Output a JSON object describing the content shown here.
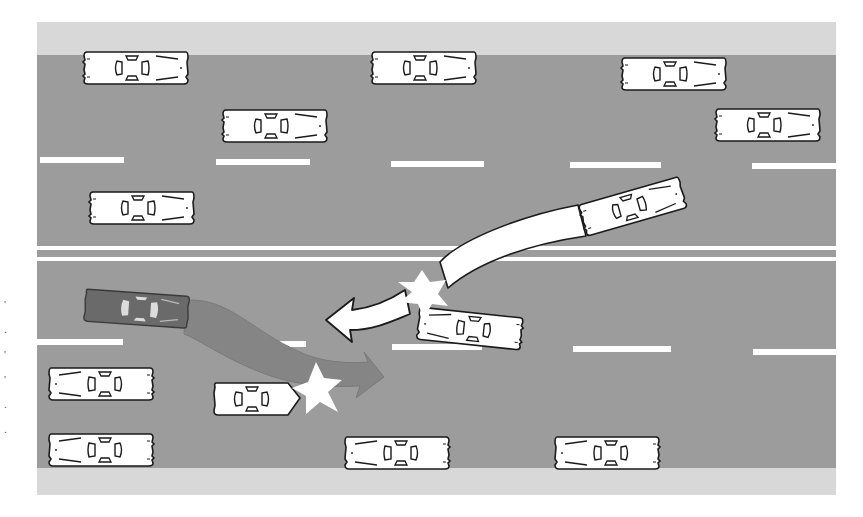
{
  "diagram": {
    "title": "",
    "type": "traffic-crash-illustration",
    "colors": {
      "background": "#ffffff",
      "shoulder": "#d6d6d6",
      "asphalt": "#9c9c9c",
      "lane_marking": "#ffffff",
      "car_body": "#ffffff",
      "car_outline": "#1a1a1a",
      "dark_car_body": "#6a6a6a",
      "white_path": "#ffffff",
      "gray_path": "#808080",
      "impact_star": "#ffffff"
    },
    "road": {
      "x": 37,
      "y": 22,
      "width": 799,
      "height": 473,
      "top_shoulder": {
        "y": 22,
        "height": 33
      },
      "bottom_shoulder": {
        "y": 468,
        "height": 27
      },
      "lane_dash_rows_y": [
        160,
        348
      ],
      "median_lines_y": [
        248,
        258
      ]
    },
    "cars": [
      {
        "id": "car-1",
        "x": 82,
        "y": 50,
        "angle": 0,
        "facing": "right",
        "style": "white"
      },
      {
        "id": "car-2",
        "x": 370,
        "y": 50,
        "angle": 0,
        "facing": "right",
        "style": "white"
      },
      {
        "id": "car-3",
        "x": 620,
        "y": 56,
        "angle": 0,
        "facing": "right",
        "style": "white"
      },
      {
        "id": "car-4",
        "x": 221,
        "y": 108,
        "angle": 0,
        "facing": "right",
        "style": "white"
      },
      {
        "id": "car-5",
        "x": 714,
        "y": 107,
        "angle": 0,
        "facing": "right",
        "style": "white"
      },
      {
        "id": "car-6",
        "x": 88,
        "y": 190,
        "angle": 0,
        "facing": "right",
        "style": "white"
      },
      {
        "id": "car-swerving",
        "x": 575,
        "y": 180,
        "angle": -14,
        "facing": "right",
        "style": "white"
      },
      {
        "id": "car-struck",
        "x": 417,
        "y": 305,
        "angle": 6,
        "facing": "right",
        "style": "white"
      },
      {
        "id": "car-dark",
        "x": 84,
        "y": 288,
        "angle": 4,
        "facing": "left",
        "style": "dark"
      },
      {
        "id": "car-7",
        "x": 47,
        "y": 366,
        "angle": 0,
        "facing": "left",
        "style": "white"
      },
      {
        "id": "car-8",
        "x": 212,
        "y": 381,
        "angle": 0,
        "facing": "left-nose",
        "style": "white"
      },
      {
        "id": "car-9",
        "x": 47,
        "y": 432,
        "angle": 0,
        "facing": "left",
        "style": "white"
      },
      {
        "id": "car-10",
        "x": 343,
        "y": 435,
        "angle": 0,
        "facing": "left",
        "style": "white"
      },
      {
        "id": "car-11",
        "x": 553,
        "y": 435,
        "angle": 0,
        "facing": "left",
        "style": "white"
      }
    ],
    "paths": [
      {
        "id": "white-swerve-arrow",
        "description": "Swerving car crosses median and heads left after impact",
        "color": "white"
      },
      {
        "id": "gray-swerve-arrow",
        "description": "Dark car's path drifting right into lower lane",
        "color": "gray"
      }
    ],
    "impact_points": [
      {
        "id": "impact-upper",
        "x": 422,
        "y": 290
      },
      {
        "id": "impact-lower",
        "x": 318,
        "y": 393
      }
    ]
  }
}
